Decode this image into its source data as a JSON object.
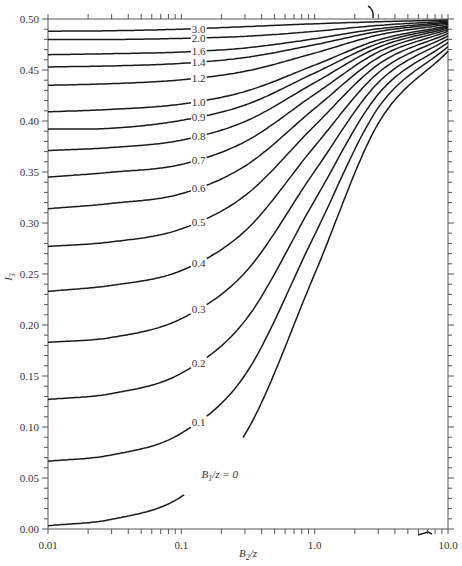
{
  "chart_data": {
    "type": "line",
    "title": "",
    "xlabel": "B2/z",
    "xlabel_parts": {
      "base": "B",
      "sub": "2",
      "rest": "/z"
    },
    "ylabel": "I3",
    "ylabel_parts": {
      "base": "I",
      "sub": "3"
    },
    "xscale": "log",
    "xlim": [
      0.01,
      10.0
    ],
    "ylim": [
      0.0,
      0.5
    ],
    "grid": false,
    "x_tick_labels": [
      "0.01",
      "0.1",
      "1.0",
      "10.0"
    ],
    "x_ticks": [
      0.01,
      0.1,
      1.0,
      10.0
    ],
    "y_tick_labels": [
      "0.00",
      "0.05",
      "0.10",
      "0.15",
      "0.20",
      "0.25",
      "0.30",
      "0.35",
      "0.40",
      "0.45",
      "0.50"
    ],
    "y_ticks": [
      0.0,
      0.05,
      0.1,
      0.15,
      0.2,
      0.25,
      0.3,
      0.35,
      0.4,
      0.45,
      0.5
    ],
    "x": [
      0.01,
      0.03,
      0.1,
      0.3,
      1.0,
      3.0,
      10.0
    ],
    "series": [
      {
        "name": "B1/z = 0",
        "label": "B1/z = 0",
        "param": 0.0,
        "values": [
          0.0032,
          0.0095,
          0.0317,
          0.0928,
          0.25,
          0.3976,
          0.4683
        ]
      },
      {
        "name": "0.1",
        "label": "0.1",
        "param": 0.1,
        "values": [
          0.0664,
          0.0726,
          0.0939,
          0.1509,
          0.2885,
          0.413,
          0.473
        ]
      },
      {
        "name": "0.2",
        "label": "0.2",
        "param": 0.2,
        "values": [
          0.127,
          0.1328,
          0.1527,
          0.2041,
          0.3221,
          0.4263,
          0.477
        ]
      },
      {
        "name": "0.3",
        "label": "0.3",
        "param": 0.3,
        "values": [
          0.183,
          0.1878,
          0.2062,
          0.2513,
          0.3508,
          0.4377,
          0.4805
        ]
      },
      {
        "name": "0.4",
        "label": "0.4",
        "param": 0.4,
        "values": [
          0.233,
          0.2389,
          0.2534,
          0.2921,
          0.3752,
          0.4473,
          0.4834
        ]
      },
      {
        "name": "0.5",
        "label": "0.5",
        "param": 0.5,
        "values": [
          0.277,
          0.2815,
          0.2942,
          0.3268,
          0.3955,
          0.4554,
          0.4859
        ]
      },
      {
        "name": "0.6",
        "label": "0.6",
        "param": 0.6,
        "values": [
          0.314,
          0.3192,
          0.3287,
          0.3558,
          0.4123,
          0.4621,
          0.488
        ]
      },
      {
        "name": "0.7",
        "label": "0.7",
        "param": 0.7,
        "values": [
          0.345,
          0.3498,
          0.3574,
          0.3797,
          0.4262,
          0.4676,
          0.4897
        ]
      },
      {
        "name": "0.8",
        "label": "0.8",
        "param": 0.8,
        "values": [
          0.371,
          0.374,
          0.3812,
          0.3995,
          0.4376,
          0.4722,
          0.4911
        ]
      },
      {
        "name": "0.9",
        "label": "0.9",
        "param": 0.9,
        "values": [
          0.392,
          0.3929,
          0.4006,
          0.4156,
          0.4471,
          0.476,
          0.4923
        ]
      },
      {
        "name": "1.0",
        "label": "1.0",
        "param": 1.0,
        "values": [
          0.409,
          0.4114,
          0.4166,
          0.4289,
          0.4548,
          0.4794,
          0.4933
        ]
      },
      {
        "name": "1.2",
        "label": "1.2",
        "param": 1.2,
        "values": [
          0.435,
          0.4366,
          0.4404,
          0.4487,
          0.4666,
          0.4843,
          0.4948
        ]
      },
      {
        "name": "1.4",
        "label": "1.4",
        "param": 1.4,
        "values": [
          0.453,
          0.454,
          0.4565,
          0.4622,
          0.4748,
          0.4878,
          0.496
        ]
      },
      {
        "name": "1.6",
        "label": "1.6",
        "param": 1.6,
        "values": [
          0.465,
          0.466,
          0.4676,
          0.4716,
          0.4806,
          0.4904,
          0.4968
        ]
      },
      {
        "name": "2.0",
        "label": "2.0",
        "param": 2.0,
        "values": [
          0.48,
          0.48,
          0.481,
          0.483,
          0.4879,
          0.4937,
          0.4979
        ]
      },
      {
        "name": "3.0",
        "label": "3.0",
        "param": 3.0,
        "values": [
          0.488,
          0.4885,
          0.49,
          0.4925,
          0.4953,
          0.4973,
          0.499
        ]
      }
    ],
    "legend": "inline curve labels near B2/z ≈ 0.13",
    "colors": {
      "line": "#1a1a1a",
      "axis": "#555555",
      "text": "#333333"
    }
  }
}
